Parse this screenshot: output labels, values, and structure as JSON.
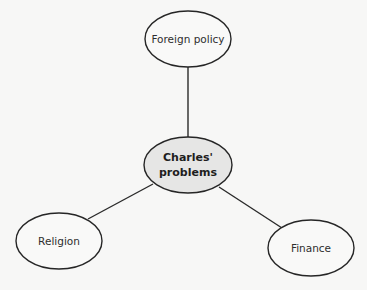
{
  "diagram": {
    "type": "mind-map",
    "colors": {
      "background": "#f7f7f6",
      "outer_node_fill": "#f9f9f8",
      "central_node_fill": "#e6e6e5",
      "stroke": "#262626",
      "text": "#2e2e2e"
    },
    "central_node": {
      "id": "charles-problems",
      "label_lines": [
        "Charles'",
        "problems"
      ],
      "bold": true,
      "cx": 188,
      "cy": 165,
      "rx": 44,
      "ry": 28
    },
    "nodes": [
      {
        "id": "foreign-policy",
        "label": "Foreign policy",
        "cx": 188,
        "cy": 39,
        "rx": 43,
        "ry": 28
      },
      {
        "id": "religion",
        "label": "Religion",
        "cx": 59,
        "cy": 241,
        "rx": 43,
        "ry": 28
      },
      {
        "id": "finance",
        "label": "Finance",
        "cx": 311,
        "cy": 248,
        "rx": 43,
        "ry": 28
      }
    ],
    "edges": [
      {
        "from": "charles-problems",
        "to": "foreign-policy",
        "x1": 188,
        "y1": 137,
        "x2": 188,
        "y2": 67
      },
      {
        "from": "charles-problems",
        "to": "religion",
        "x1": 153,
        "y1": 184,
        "x2": 88,
        "y2": 219
      },
      {
        "from": "charles-problems",
        "to": "finance",
        "x1": 219,
        "y1": 187,
        "x2": 282,
        "y2": 228
      }
    ]
  }
}
